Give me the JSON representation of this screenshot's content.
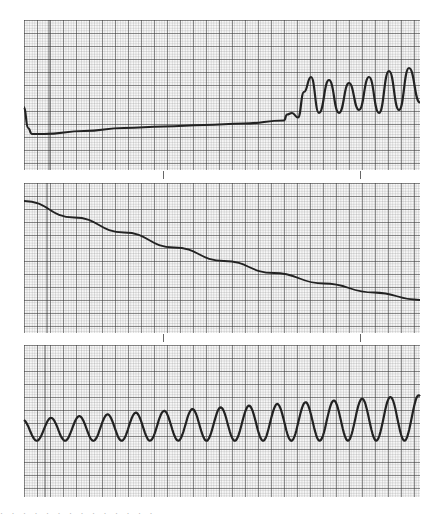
{
  "chart_data": [
    {
      "type": "line",
      "title": "",
      "panel": "top",
      "xlabel": "",
      "ylabel": "",
      "grid": true,
      "description": "Chart-recorder trace: sharp initial drop, slow linear rise, then onset of growing oscillations",
      "x": [
        0,
        4,
        8,
        20,
        60,
        100,
        140,
        180,
        220,
        260,
        263,
        268,
        274,
        280,
        287,
        295,
        305,
        315,
        325,
        335,
        345,
        355,
        365,
        375,
        385,
        396
      ],
      "y": [
        0.42,
        0.28,
        0.24,
        0.24,
        0.26,
        0.28,
        0.29,
        0.3,
        0.31,
        0.33,
        0.37,
        0.38,
        0.35,
        0.52,
        0.62,
        0.38,
        0.6,
        0.38,
        0.58,
        0.4,
        0.62,
        0.38,
        0.66,
        0.4,
        0.68,
        0.45
      ]
    },
    {
      "type": "line",
      "title": "",
      "panel": "middle",
      "xlabel": "",
      "ylabel": "",
      "grid": true,
      "description": "Smooth monotonically decreasing (decaying) trace",
      "x": [
        0,
        50,
        100,
        150,
        200,
        250,
        300,
        350,
        396
      ],
      "y": [
        0.88,
        0.77,
        0.67,
        0.57,
        0.48,
        0.4,
        0.33,
        0.27,
        0.22
      ]
    },
    {
      "type": "line",
      "title": "",
      "panel": "bottom",
      "xlabel": "",
      "ylabel": "",
      "grid": true,
      "description": "Sustained oscillation (~14 cycles) with slowly increasing amplitude and mean",
      "cycles": 14,
      "amplitude_start": 0.07,
      "amplitude_end": 0.15,
      "mean_start": 0.44,
      "mean_end": 0.52
    }
  ],
  "caption": "· · ·   · · ·  · ·    · · ·   · · ·"
}
